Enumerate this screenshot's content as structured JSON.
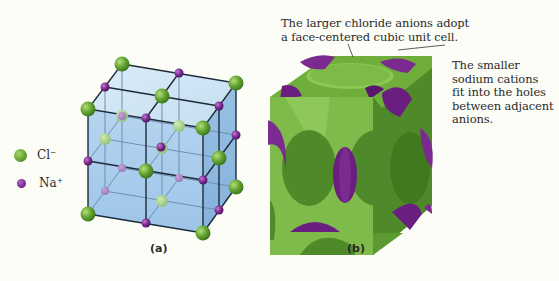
{
  "legend": {
    "items": [
      {
        "symbol": "Cl",
        "charge": "−",
        "color": "#6aa838",
        "label": "Cl⁻"
      },
      {
        "symbol": "Na",
        "charge": "+",
        "color": "#7b2a8f",
        "label": "Na⁺"
      }
    ]
  },
  "panels": {
    "a": {
      "label": "(a)",
      "description": "Ball-and-stick NaCl lattice in a blue cube"
    },
    "b": {
      "label": "(b)",
      "description": "Space-filling NaCl unit cell"
    }
  },
  "annotations": {
    "chloride": {
      "lines": [
        "The larger chloride anions adopt",
        "a face-centered cubic unit cell."
      ]
    },
    "sodium": {
      "lines": [
        "The smaller",
        "sodium cations",
        "fit into the holes",
        "between adjacent",
        "anions."
      ]
    }
  },
  "colors": {
    "background": "#fdfdf8",
    "chloride": "#6aa838",
    "chloride_dark": "#3f7a1e",
    "sodium": "#7b2a8f",
    "cube_fill": "#9fc8ea",
    "edge": "#1e2a38"
  }
}
